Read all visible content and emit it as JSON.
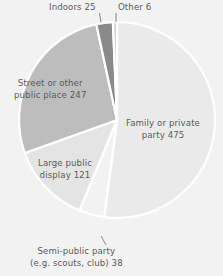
{
  "chart_data": {
    "type": "pie",
    "title": "",
    "subtitle": "",
    "xlabel": "",
    "ylabel": "",
    "legend_position": "none",
    "grid": false,
    "total": 912,
    "units": "incidents",
    "categories": [
      "Family or private party",
      "Semi-public party (e.g. scouts, club)",
      "Large public display",
      "Street or other public place",
      "Indoors",
      "Other"
    ],
    "values": [
      475,
      38,
      121,
      247,
      25,
      6
    ],
    "slices": [
      {
        "name": "Family or private party",
        "label_lines": [
          "Family or private",
          "party 475"
        ],
        "value": 475,
        "percent": 52.1,
        "color": "#eaeaea",
        "start_deg": 0,
        "end_deg": 187.5
      },
      {
        "name": "Semi-public party (e.g. scouts, club)",
        "label_lines": [
          "Semi-public party",
          "(e.g. scouts, club) 38"
        ],
        "value": 38,
        "percent": 4.2,
        "color": "#f2f2f2",
        "start_deg": 187.5,
        "end_deg": 202.5,
        "has_leader_line": true
      },
      {
        "name": "Large public display",
        "label_lines": [
          "Large public",
          "display 121"
        ],
        "value": 121,
        "percent": 13.3,
        "color": "#e4e4e4",
        "start_deg": 202.5,
        "end_deg": 250.3
      },
      {
        "name": "Street or other public place",
        "label_lines": [
          "Street or other",
          "public place 247"
        ],
        "value": 247,
        "percent": 27.1,
        "color": "#bdbdbd",
        "start_deg": 250.3,
        "end_deg": 347.8
      },
      {
        "name": "Indoors",
        "label_lines": [
          "Indoors 25"
        ],
        "value": 25,
        "percent": 2.7,
        "color": "#8a8a8a",
        "start_deg": 347.8,
        "end_deg": 357.6,
        "has_leader_line": true
      },
      {
        "name": "Other",
        "label_lines": [
          "Other 6"
        ],
        "value": 6,
        "percent": 0.7,
        "color": "#cfcfcf",
        "start_deg": 357.6,
        "end_deg": 360,
        "has_leader_line": true
      }
    ]
  },
  "labels": {
    "family_line1": "Family or private",
    "family_line2": "party 475",
    "street_line1": "Street or other",
    "street_line2": "public place 247",
    "large_line1": "Large public",
    "large_line2": "display 121",
    "semi_line1": "Semi-public party",
    "semi_line2": "(e.g. scouts, club) 38",
    "indoors": "Indoors 25",
    "other": "Other 6"
  },
  "colors": {
    "background": "#f2f2f2",
    "text": "#5b5b5b",
    "slice_family": "#eaeaea",
    "slice_semi": "#f2f2f2",
    "slice_large": "#e4e4e4",
    "slice_street": "#bdbdbd",
    "slice_indoors": "#8a8a8a",
    "slice_other": "#cfcfcf",
    "slice_border": "#ffffff",
    "leader_line": "#9a9a9a"
  }
}
